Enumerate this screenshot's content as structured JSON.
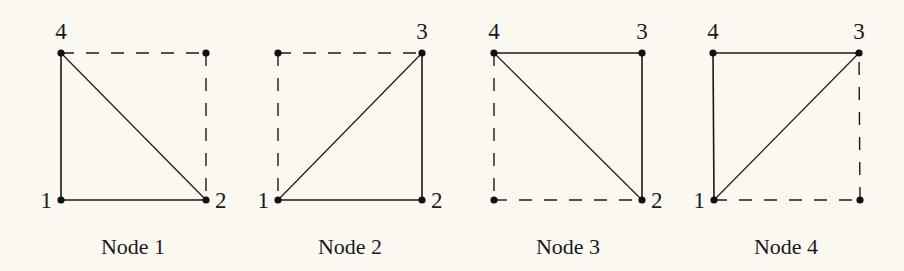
{
  "diagram": {
    "type": "finite-element-node-shape-functions",
    "background_color": "#faf8f0",
    "line_color": "#1a1a1a",
    "panels": [
      {
        "label": "Node 1",
        "corners": {
          "bl": {
            "x": 61,
            "y": 200,
            "number": "1"
          },
          "br": {
            "x": 206,
            "y": 200,
            "number": "2"
          },
          "tr": {
            "x": 206,
            "y": 53,
            "number": ""
          },
          "tl": {
            "x": 61,
            "y": 53,
            "number": "4"
          }
        },
        "solid_edges": [
          [
            "bl",
            "br"
          ],
          [
            "bl",
            "tl"
          ]
        ],
        "diagonal": [
          "tl",
          "br"
        ],
        "dashed_edges": [
          [
            "tl",
            "tr"
          ],
          [
            "tr",
            "br"
          ]
        ],
        "label_pos": {
          "x": 133,
          "y": 254
        }
      },
      {
        "label": "Node 2",
        "corners": {
          "bl": {
            "x": 278,
            "y": 200,
            "number": "1"
          },
          "br": {
            "x": 422,
            "y": 200,
            "number": "2"
          },
          "tr": {
            "x": 422,
            "y": 53,
            "number": "3"
          },
          "tl": {
            "x": 278,
            "y": 53,
            "number": ""
          }
        },
        "solid_edges": [
          [
            "bl",
            "br"
          ],
          [
            "br",
            "tr"
          ]
        ],
        "diagonal": [
          "bl",
          "tr"
        ],
        "dashed_edges": [
          [
            "tl",
            "tr"
          ],
          [
            "tl",
            "bl"
          ]
        ],
        "label_pos": {
          "x": 350,
          "y": 254
        }
      },
      {
        "label": "Node 3",
        "corners": {
          "bl": {
            "x": 494,
            "y": 200,
            "number": ""
          },
          "br": {
            "x": 642,
            "y": 200,
            "number": "2"
          },
          "tr": {
            "x": 642,
            "y": 53,
            "number": "3"
          },
          "tl": {
            "x": 494,
            "y": 53,
            "number": "4"
          }
        },
        "solid_edges": [
          [
            "tl",
            "tr"
          ],
          [
            "tr",
            "br"
          ]
        ],
        "diagonal": [
          "tl",
          "br"
        ],
        "dashed_edges": [
          [
            "bl",
            "br"
          ],
          [
            "tl",
            "bl"
          ]
        ],
        "label_pos": {
          "x": 568,
          "y": 254
        }
      },
      {
        "label": "Node 4",
        "corners": {
          "bl": {
            "x": 714,
            "y": 200,
            "number": "1"
          },
          "br": {
            "x": 860,
            "y": 200,
            "number": ""
          },
          "tr": {
            "x": 859,
            "y": 53,
            "number": "3"
          },
          "tl": {
            "x": 713,
            "y": 53,
            "number": "4"
          }
        },
        "solid_edges": [
          [
            "tl",
            "tr"
          ],
          [
            "tl",
            "bl"
          ]
        ],
        "diagonal": [
          "bl",
          "tr"
        ],
        "dashed_edges": [
          [
            "bl",
            "br"
          ],
          [
            "br",
            "tr"
          ]
        ],
        "label_pos": {
          "x": 786,
          "y": 254
        }
      }
    ]
  }
}
